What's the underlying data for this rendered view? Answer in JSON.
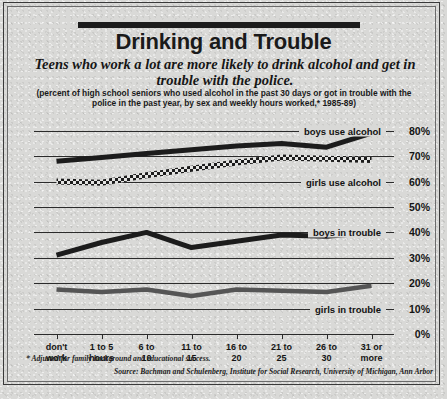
{
  "title": "Drinking and Trouble",
  "deck": "Teens who work a lot are more likely to drink alcohol and get in trouble with the police.",
  "subdeck": "(percent of high school seniors who used alcohol in the past 30 days or got in trouble with the police in the past year, by sex and weekly hours worked,* 1985-89)",
  "footnote": "* Adjusted for family background and educational success.",
  "source": "Source: Bachman and Schulenberg, Institute for Social Research, University of Michigan, Ann Arbor",
  "colors": {
    "ink": "#1a1a1a",
    "paper": "#d9d9d7",
    "line": "#1c1c1c",
    "line_gray": "#555555"
  },
  "chart_data": {
    "type": "line",
    "title": "Drinking and Trouble",
    "xlabel": "",
    "ylabel": "percent",
    "ylim": [
      0,
      85
    ],
    "yticks": [
      0,
      10,
      20,
      30,
      40,
      50,
      60,
      70,
      80
    ],
    "ytick_labels": [
      "0%",
      "10%",
      "20%",
      "30%",
      "40%",
      "50%",
      "60%",
      "70%",
      "80%"
    ],
    "grid": true,
    "legend_position": "inline-right",
    "categories": [
      "don't work",
      "1 to 5 hours",
      "6 to 10",
      "11 to 15",
      "16 to 20",
      "21 to 25",
      "26 to 30",
      "31 or more"
    ],
    "category_lines": [
      [
        "don't",
        "work"
      ],
      [
        "1 to 5",
        "hours"
      ],
      [
        "6 to",
        "10"
      ],
      [
        "11 to",
        "15"
      ],
      [
        "16 to",
        "20"
      ],
      [
        "21 to",
        "25"
      ],
      [
        "26 to",
        "30"
      ],
      [
        "31 or",
        "more"
      ]
    ],
    "series": [
      {
        "name": "boys use alcohol",
        "style": "solid-thick",
        "values": [
          68,
          69.5,
          71,
          72.5,
          74,
          75,
          73.5,
          79
        ]
      },
      {
        "name": "girls use alcohol",
        "style": "checkered",
        "values": [
          60,
          59.5,
          62.5,
          65,
          67.5,
          69.5,
          69,
          68.5
        ]
      },
      {
        "name": "boys in trouble",
        "style": "solid-thick",
        "values": [
          31,
          36,
          40,
          34,
          36.5,
          39,
          38.5,
          40
        ]
      },
      {
        "name": "girls in trouble",
        "style": "solid-gray",
        "values": [
          17.5,
          16.5,
          17.5,
          15,
          17.5,
          17,
          16.5,
          19
        ]
      }
    ]
  }
}
